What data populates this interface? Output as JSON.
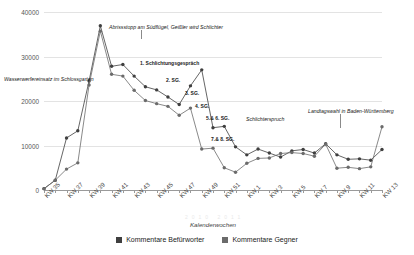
{
  "axes": {
    "ylabel": "Anzahl - Kommentare",
    "xlabel": "Kalenderwochen",
    "yticks": [
      "0",
      "10000",
      "20000",
      "30000",
      "40000"
    ]
  },
  "legend": {
    "items": [
      {
        "label": "Kommentare Befürworter",
        "color": "#3f3f3f"
      },
      {
        "label": "Kommentare Gegner",
        "color": "#6b6b6b"
      }
    ]
  },
  "annotations": [
    {
      "text": "Wasserwerfereinsatz im Schlossgarten",
      "style": "italic"
    },
    {
      "text": "Abrissstopp am Südflügel, Geißler wird Schlichter",
      "style": "italic"
    },
    {
      "text": "1. Schlichtungsgespräch",
      "style": "bold"
    },
    {
      "text": "2. SG.",
      "style": "bold"
    },
    {
      "text": "3. SG.",
      "style": "bold"
    },
    {
      "text": "4. SG.",
      "style": "bold"
    },
    {
      "text": "5.& 6. SG.",
      "style": "bold"
    },
    {
      "text": "7.& 8. SG.",
      "style": "bold"
    },
    {
      "text": "Schlichterspruch",
      "style": "italic"
    },
    {
      "text": "Landtagswahl in Baden-Württemberg",
      "style": "italic"
    }
  ],
  "chart_data": {
    "type": "line",
    "title": "",
    "xlabel": "Kalenderwochen",
    "ylabel": "Anzahl - Kommentare",
    "ylim": [
      0,
      40000
    ],
    "grid": true,
    "legend_position": "bottom",
    "categories": [
      "KW 35",
      "KW 36",
      "KW 37",
      "KW 38",
      "KW 39",
      "KW 40",
      "KW 41",
      "KW 42",
      "KW 43",
      "KW 44",
      "KW 45",
      "KW 46",
      "KW 47",
      "KW 48",
      "KW 49",
      "KW 50",
      "KW 51",
      "KW 52",
      "KW 1",
      "KW 2",
      "KW 3",
      "KW 4",
      "KW 5",
      "KW 6",
      "KW 7",
      "KW 8",
      "KW 9",
      "KW 10",
      "KW 11",
      "KW 12",
      "KW 13"
    ],
    "tick_labels": [
      "KW 35",
      "",
      "KW 37",
      "",
      "KW 39",
      "",
      "KW 41",
      "",
      "KW 43",
      "",
      "KW 45",
      "",
      "KW 47",
      "",
      "KW 49",
      "",
      "KW 51",
      "",
      "KW 1",
      "",
      "KW 3",
      "",
      "KW 5",
      "",
      "KW 7",
      "",
      "KW 9",
      "",
      "KW 11",
      "",
      "KW 13"
    ],
    "series": [
      {
        "name": "Kommentare Befürworter",
        "color": "#3f3f3f",
        "values": [
          300,
          2200,
          11700,
          13300,
          24500,
          36900,
          27800,
          28200,
          25600,
          23200,
          22500,
          20900,
          19200,
          23400,
          27000,
          14000,
          14300,
          9700,
          7900,
          9200,
          8300,
          7400,
          8800,
          9100,
          8300,
          10400,
          7900,
          6900,
          7000,
          6700,
          9100
        ]
      },
      {
        "name": "Kommentare Gegner",
        "color": "#6b6b6b",
        "values": [
          300,
          2200,
          4700,
          6100,
          23600,
          35700,
          26000,
          25600,
          22400,
          20100,
          19400,
          18800,
          16800,
          18400,
          9200,
          9400,
          5000,
          4000,
          6000,
          7100,
          7200,
          8200,
          8400,
          8200,
          7600,
          10300,
          4900,
          5100,
          4800,
          5200,
          14200
        ]
      }
    ]
  }
}
